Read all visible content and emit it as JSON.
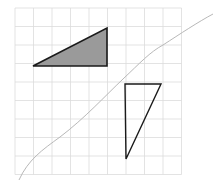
{
  "diagram": {
    "width": 216,
    "height": 187,
    "background": "#ffffff",
    "grid": {
      "x0": 15,
      "y0": 8,
      "cols": 9,
      "rows": 9,
      "cell": 18.5,
      "color": "#dcdcdc",
      "stroke_width": 0.8
    },
    "shapes": [
      {
        "id": "shaded-triangle",
        "points": [
          [
            33,
            66
          ],
          [
            107,
            28
          ],
          [
            107,
            66
          ]
        ],
        "fill": "#9a9a9a",
        "stroke": "#1a1a1a",
        "stroke_width": 1.6
      },
      {
        "id": "outlined-triangle",
        "points": [
          [
            125,
            84
          ],
          [
            161,
            84
          ],
          [
            126,
            159
          ]
        ],
        "fill": "none",
        "stroke": "#1a1a1a",
        "stroke_width": 1.4
      }
    ],
    "curve": {
      "id": "diagonal-curve",
      "path": "M19,180 C28,160 42,150 60,137 C85,118 105,96 123,79 C140,63 150,52 163,45 C180,34 198,22 213,14",
      "stroke": "#b8b8b8",
      "stroke_width": 1
    }
  }
}
